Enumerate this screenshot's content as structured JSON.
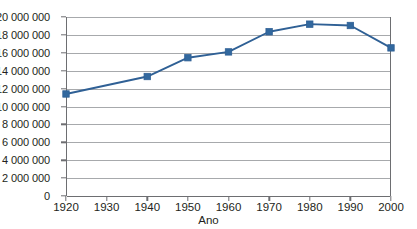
{
  "chart_data": {
    "type": "line",
    "title": "",
    "xlabel": "Ano",
    "ylabel": "",
    "x": [
      1920,
      1940,
      1950,
      1960,
      1970,
      1980,
      1990,
      2000
    ],
    "values": [
      11400000,
      13350000,
      15450000,
      16100000,
      18350000,
      19200000,
      19050000,
      16550000
    ],
    "series": [
      {
        "name": "",
        "x": [
          1920,
          1940,
          1950,
          1960,
          1970,
          1980,
          1990,
          2000
        ],
        "values": [
          11400000,
          13350000,
          15450000,
          16100000,
          18350000,
          19200000,
          19050000,
          16550000
        ]
      }
    ],
    "xlim": [
      1920,
      2000
    ],
    "ylim": [
      0,
      20000000
    ],
    "x_ticks": [
      1920,
      1930,
      1940,
      1950,
      1960,
      1970,
      1980,
      1990,
      2000
    ],
    "x_tick_labels": [
      "1920",
      "1930",
      "1940",
      "1950",
      "1960",
      "1970",
      "1980",
      "1990",
      "2000"
    ],
    "y_ticks": [
      0,
      2000000,
      4000000,
      6000000,
      8000000,
      10000000,
      12000000,
      14000000,
      16000000,
      18000000,
      20000000
    ],
    "y_tick_labels": [
      "0",
      "2 000 000",
      "4 000 000",
      "6 000 000",
      "8 000 000",
      "10 000 000",
      "12 000 000",
      "14 000 000",
      "16 000 000",
      "18 000 000",
      "20 000 000"
    ],
    "grid": "horizontal",
    "legend": "none",
    "marker": "square",
    "colors": {
      "line": "#2f6095",
      "marker": "#32689e",
      "gridline": "#a7a9ac",
      "axis": "#6d6e71",
      "text": "#231f20",
      "background": "#ffffff"
    }
  }
}
